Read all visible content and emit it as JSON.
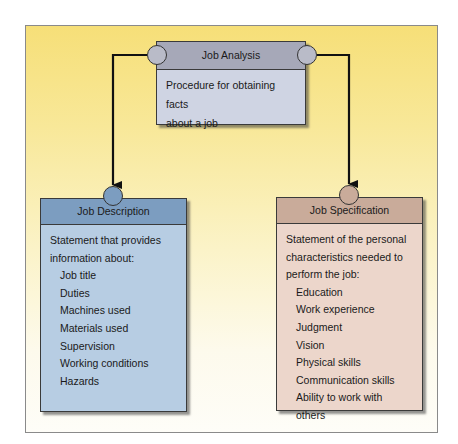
{
  "diagram": {
    "type": "flow",
    "nodes": {
      "analysis": {
        "title": "Job Analysis",
        "description": [
          "Procedure for obtaining facts",
          "about a job"
        ]
      },
      "description": {
        "title": "Job Description",
        "intro": [
          "Statement that provides",
          "information about:"
        ],
        "items": [
          "Job title",
          "Duties",
          "Machines used",
          "Materials used",
          "Supervision",
          "Working conditions",
          "Hazards"
        ]
      },
      "specification": {
        "title": "Job Specification",
        "intro": [
          "Statement of the personal",
          "characteristics needed to",
          "perform the job:"
        ],
        "items": [
          "Education",
          "Work experience",
          "Judgment",
          "Vision",
          "Physical skills",
          "Communication skills",
          "Ability to work with others"
        ]
      }
    },
    "edges": [
      {
        "from": "analysis",
        "to": "description"
      },
      {
        "from": "analysis",
        "to": "specification"
      }
    ],
    "colors": {
      "background_top": "#f6df78",
      "background_bottom": "#fefdf8",
      "analysis_header": "#a6a8b8",
      "analysis_body": "#cfd4e3",
      "description_header": "#7c9dc0",
      "description_body": "#b7cde3",
      "specification_header": "#c9ab9a",
      "specification_body": "#ecd6cb"
    }
  }
}
